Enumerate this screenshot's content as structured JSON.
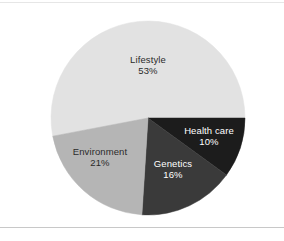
{
  "figure": {
    "background_color": "#ffffff",
    "rule_color": "#c8c8c8"
  },
  "chart_data": {
    "type": "pie",
    "title": "",
    "subtitle": "",
    "xlabel": "",
    "ylabel": "",
    "legend_position": "none",
    "grid": false,
    "labels_inside_slices": true,
    "start_angle_deg": 0,
    "direction": "clockwise",
    "center": {
      "x": 148,
      "y": 118
    },
    "radius": 97,
    "categories": [
      "Lifestyle",
      "Health care",
      "Genetics",
      "Environment"
    ],
    "values": [
      53,
      10,
      16,
      21
    ],
    "unit": "%",
    "slices": [
      {
        "name": "Lifestyle",
        "label": "Lifestyle",
        "value": 53,
        "value_text": "53%",
        "color": "#e2e2e2",
        "text_color": "#2b2b2b",
        "start_angle_deg": 169.2,
        "end_angle_deg": 360.0
      },
      {
        "name": "Health care",
        "label": "Health care",
        "value": 10,
        "value_text": "10%",
        "color": "#1c1c1c",
        "text_color": "#ffffff",
        "start_angle_deg": 0.0,
        "end_angle_deg": 36.0
      },
      {
        "name": "Genetics",
        "label": "Genetics",
        "value": 16,
        "value_text": "16%",
        "color": "#3a3a3a",
        "text_color": "#ffffff",
        "start_angle_deg": 36.0,
        "end_angle_deg": 93.6
      },
      {
        "name": "Environment",
        "label": "Environment",
        "value": 21,
        "value_text": "21%",
        "color": "#b5b5b5",
        "text_color": "#2b2b2b",
        "start_angle_deg": 93.6,
        "end_angle_deg": 169.2
      }
    ]
  }
}
